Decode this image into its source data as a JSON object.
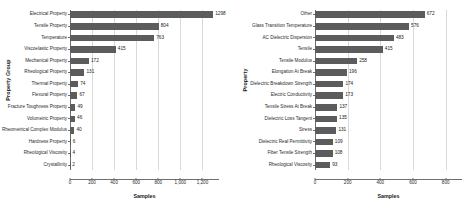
{
  "chart_data": [
    {
      "type": "bar",
      "orientation": "horizontal",
      "title": "",
      "xlabel": "Samples",
      "ylabel": "Property Group",
      "xlim": [
        0,
        1350
      ],
      "xticks": [
        0,
        200,
        400,
        600,
        800,
        1000,
        1200
      ],
      "xticklabels": [
        "0",
        "200",
        "400",
        "600",
        "800",
        "1,000",
        "1,200"
      ],
      "grid": true,
      "legend": "none",
      "bar_color": "#5c5c5c",
      "categories": [
        "Electrical Property",
        "Tensile Property",
        "Temperature",
        "Viscoelastic Property",
        "Mechanical Property",
        "Rheological Property",
        "Thermal Property",
        "Flexural Property",
        "Fracture Toughness Property",
        "Volumetric Property",
        "Rheometrical Complex Modulus",
        "Hardness Property",
        "Rheological Viscosity",
        "Crystallinity"
      ],
      "values": [
        1298,
        804,
        763,
        415,
        172,
        131,
        74,
        67,
        49,
        46,
        40,
        6,
        4,
        2
      ],
      "value_labels": [
        "1298",
        "804",
        "763",
        "415",
        "172",
        "131",
        "74",
        "67",
        "49",
        "46",
        "40",
        "6",
        "4",
        "2"
      ]
    },
    {
      "type": "bar",
      "orientation": "horizontal",
      "title": "",
      "xlabel": "Samples",
      "ylabel": "Property",
      "xlim": [
        0,
        900
      ],
      "xticks": [
        0,
        200,
        400,
        600,
        800
      ],
      "xticklabels": [
        "0",
        "200",
        "400",
        "600",
        "800"
      ],
      "grid": true,
      "legend": "none",
      "bar_color": "#5c5c5c",
      "categories": [
        "Other",
        "Glass Transition Temperature",
        "AC Dielectric Dispersion",
        "Tensile",
        "Tensile Modulus",
        "Elongation At Break",
        "Dielectric Breakdown Strength",
        "Electric Conductivity",
        "Tensile Stress At Break",
        "Dielectric Loss Tangent",
        "Stress",
        "Dielectric Real Permittivity",
        "Fiber Tensile Strength",
        "Rheological Viscosity"
      ],
      "values": [
        672,
        576,
        483,
        415,
        258,
        196,
        174,
        173,
        137,
        135,
        131,
        109,
        108,
        93
      ],
      "value_labels": [
        "672",
        "576",
        "483",
        "415",
        "258",
        "196",
        "174",
        "173",
        "137",
        "135",
        "131",
        "109",
        "108",
        "93"
      ]
    }
  ]
}
